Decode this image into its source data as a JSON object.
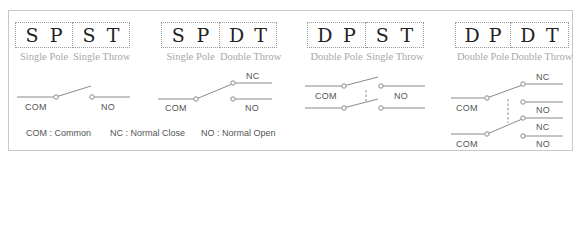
{
  "diagrams": [
    {
      "id": "spst",
      "pole_letters": [
        "S",
        "P"
      ],
      "throw_letters": [
        "S",
        "T"
      ],
      "pole_caption": "Single Pole",
      "throw_caption": "Single Throw",
      "labels": {
        "com": "COM",
        "no": "NO"
      }
    },
    {
      "id": "spdt",
      "pole_letters": [
        "S",
        "P"
      ],
      "throw_letters": [
        "D",
        "T"
      ],
      "pole_caption": "Single Pole",
      "throw_caption": "Double Throw",
      "labels": {
        "com": "COM",
        "nc": "NC",
        "no": "NO"
      }
    },
    {
      "id": "dpst",
      "pole_letters": [
        "D",
        "P"
      ],
      "throw_letters": [
        "S",
        "T"
      ],
      "pole_caption": "Double Pole",
      "throw_caption": "Single Throw",
      "labels": {
        "com": "COM",
        "no": "NO"
      }
    },
    {
      "id": "dpdt",
      "pole_letters": [
        "D",
        "P"
      ],
      "throw_letters": [
        "D",
        "T"
      ],
      "pole_caption": "Double Pole",
      "throw_caption": "Double Throw",
      "labels": {
        "com_top": "COM",
        "nc_top": "NC",
        "no_top": "NO",
        "com_bottom": "COM",
        "nc_bottom": "NC",
        "no_bottom": "NO"
      }
    }
  ],
  "legend": {
    "com": "COM : Common",
    "nc": "NC : Normal Close",
    "no": "NO : Normal Open"
  },
  "colors": {
    "border": "#c8c8c8",
    "wire": "#8a8a8a",
    "letters": "#222222",
    "caption": "#a8a8a8",
    "label": "#555555"
  }
}
